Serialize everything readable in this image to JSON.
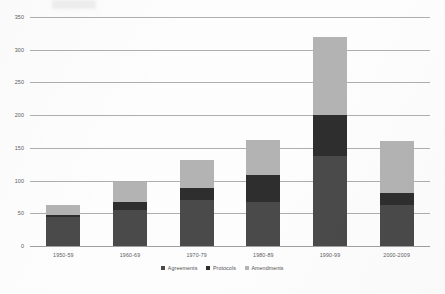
{
  "chart_data": {
    "type": "bar",
    "stacked": true,
    "title": "",
    "xlabel": "",
    "ylabel": "",
    "ylim": [
      0,
      350
    ],
    "ytick_step": 50,
    "yticks": [
      0,
      50,
      100,
      150,
      200,
      250,
      300,
      350
    ],
    "grid": true,
    "legend_position": "bottom",
    "categories": [
      "1950-59",
      "1960-69",
      "1970-79",
      "1980-89",
      "1990-99",
      "2000-2009"
    ],
    "series": [
      {
        "name": "Agreements",
        "color": "#4a4a4a",
        "values": [
          45,
          55,
          70,
          68,
          137,
          62
        ]
      },
      {
        "name": "Protocols",
        "color": "#2e2e2e",
        "values": [
          2,
          12,
          18,
          40,
          63,
          19
        ]
      },
      {
        "name": "Amendments",
        "color": "#b3b3b3",
        "values": [
          15,
          31,
          43,
          54,
          119,
          79
        ]
      }
    ],
    "totals": [
      62,
      98,
      131,
      162,
      319,
      160
    ]
  }
}
